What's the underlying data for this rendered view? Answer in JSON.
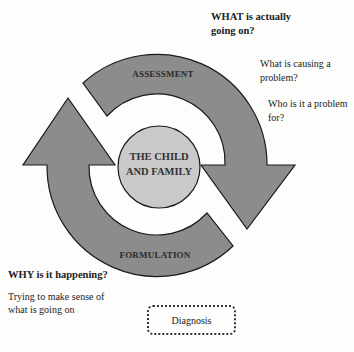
{
  "diagram": {
    "center_label": [
      "THE CHILD",
      "AND FAMILY"
    ],
    "arcs": [
      {
        "label": "ASSESSMENT",
        "direction": "clockwise",
        "position": "top"
      },
      {
        "label": "FORMULATION",
        "direction": "clockwise",
        "position": "bottom"
      }
    ],
    "colors": {
      "ring": "#8c8c8c",
      "center": "#c9c9c9",
      "stroke": "#1a1a1a",
      "background": "#fdfdfb"
    }
  },
  "annotations": {
    "what_heading": [
      "WHAT is actually",
      "going on?"
    ],
    "what_q1": [
      "What is causing a",
      "problem?"
    ],
    "what_q2": [
      "Who is it a problem",
      "for?"
    ],
    "why_heading": "WHY is it happening?",
    "why_text": [
      "Trying to make sense of",
      "what is going on"
    ]
  },
  "diagnosis_box": {
    "label": "Diagnosis"
  }
}
